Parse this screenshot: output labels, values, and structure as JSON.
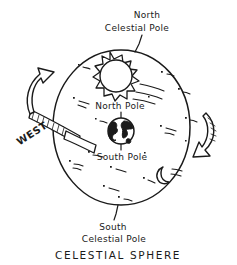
{
  "diagram": {
    "title_caption": "CELESTIAL SPHERE",
    "labels": {
      "north_celestial_pole_line1": "North",
      "north_celestial_pole_line2": "Celestial Pole",
      "south_celestial_pole_line1": "South",
      "south_celestial_pole_line2": "Celestial Pole",
      "north_pole": "North Pole",
      "south_pole": "South Pole",
      "west": "WEST"
    },
    "objects": {
      "sun": "sun-icon",
      "earth": "earth-globe-icon",
      "moon": "crescent-moon-icon",
      "sphere": "celestial-sphere-outline",
      "left_arrow": "rotation-arrow-left",
      "right_arrow": "rotation-arrow-right",
      "west_band": "west-direction-band"
    },
    "colors": {
      "ink": "#1a1a1a",
      "background": "#ffffff",
      "fill_white": "#ffffff"
    },
    "star_count": 18
  }
}
